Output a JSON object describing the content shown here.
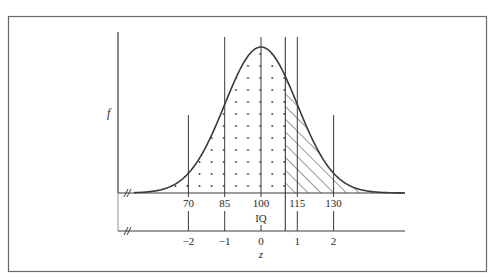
{
  "diagram": {
    "type": "normal-distribution",
    "y_axis_label": "f",
    "x_axis_label": "IQ",
    "z_axis_label": "z",
    "mean": 100,
    "sd": 15,
    "cutoff_z": 0.67,
    "iq_ticks": [
      {
        "value": 70,
        "label": "70"
      },
      {
        "value": 85,
        "label": "85"
      },
      {
        "value": 100,
        "label": "100"
      },
      {
        "value": 115,
        "label": "115"
      },
      {
        "value": 130,
        "label": "130"
      }
    ],
    "z_ticks": [
      {
        "value": -2,
        "label": "−2"
      },
      {
        "value": -1,
        "label": "−1"
      },
      {
        "value": 0,
        "label": "0"
      },
      {
        "value": 1,
        "label": "1"
      },
      {
        "value": 2,
        "label": "2"
      }
    ],
    "regions": [
      {
        "name": "left-of-cutoff",
        "fill": "dots"
      },
      {
        "name": "right-of-cutoff",
        "fill": "diagonal-hatch"
      }
    ],
    "axis_break_symbol": "//",
    "colors": {
      "line": "#3a3a3a",
      "frame": "#6a6a6a",
      "background": "#ffffff"
    }
  }
}
